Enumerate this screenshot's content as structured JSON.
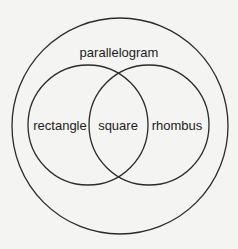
{
  "diagram": {
    "type": "venn",
    "stroke_color": "#2a2a2a",
    "background": "#f4f4f2",
    "sets": [
      {
        "id": "parallelogram",
        "label": "parallelogram",
        "contains": [
          "rectangle",
          "rhombus"
        ]
      },
      {
        "id": "rectangle",
        "label": "rectangle"
      },
      {
        "id": "rhombus",
        "label": "rhombus"
      }
    ],
    "intersection": {
      "sets": [
        "rectangle",
        "rhombus"
      ],
      "label": "square"
    }
  }
}
